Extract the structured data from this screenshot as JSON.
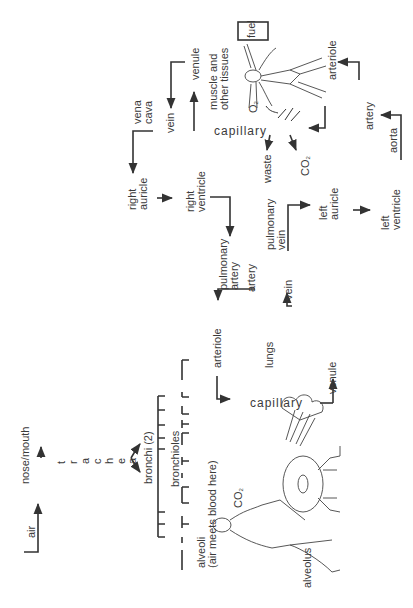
{
  "diagram": {
    "title": "",
    "orientation": "rotated -90deg",
    "labels": {
      "air": "air",
      "nose_mouth": "nose/mouth",
      "trachea_letters": [
        "t",
        "r",
        "a",
        "c",
        "h",
        "e",
        "a"
      ],
      "bronchi": "bronchi (2)",
      "bronchioles": "bronchioles",
      "alveoli_1": "alveoli",
      "alveoli_2": "(air meets blood here)",
      "co2_lungs": "CO",
      "co2_sub": "2",
      "alveolus": "alveolus",
      "capillary_lungs": "capillary",
      "arteriole_lungs": "arteriole",
      "lungs": "lungs",
      "venule_lungs": "venule",
      "pulmonary_artery_1": "pulmonary",
      "pulmonary_artery_2": "artery",
      "artery_lungs": "artery",
      "vein_lungs": "vein",
      "pulmonary_vein_1": "pulmonary",
      "pulmonary_vein_2": "vein",
      "right_auricle_1": "right",
      "right_auricle_2": "auricle",
      "right_ventricle_1": "right",
      "right_ventricle_2": "ventricle",
      "left_auricle_1": "left",
      "left_auricle_2": "auricle",
      "left_ventricle_1": "left",
      "left_ventricle_2": "ventricle",
      "vena_cava_1": "vena",
      "vena_cava_2": "cava",
      "vein_body": "vein",
      "venule_body": "venule",
      "muscle_1": "muscle and",
      "muscle_2": "other tissues",
      "fuel": "fuel",
      "o2": "O",
      "o2_sub": "2",
      "capillary_body": "capillary",
      "waste": "waste",
      "co2_body": "CO",
      "co2_body_sub": "2",
      "arteriole_body": "arteriole",
      "artery_body": "artery",
      "aorta": "aorta"
    },
    "flow": [
      "air → nose/mouth → trachea → bronchi (2) → bronchioles → alveoli",
      "right auricle → right ventricle → pulmonary artery → arteriole → capillary (lungs) → venule → vein → pulmonary vein → left auricle → left ventricle",
      "left ventricle → aorta → artery → arteriole → capillary (tissues) → venule → vein → vena cava → right auricle"
    ],
    "colors": {
      "line": "#333333",
      "text": "#3a3a3a",
      "background": "#ffffff"
    }
  }
}
